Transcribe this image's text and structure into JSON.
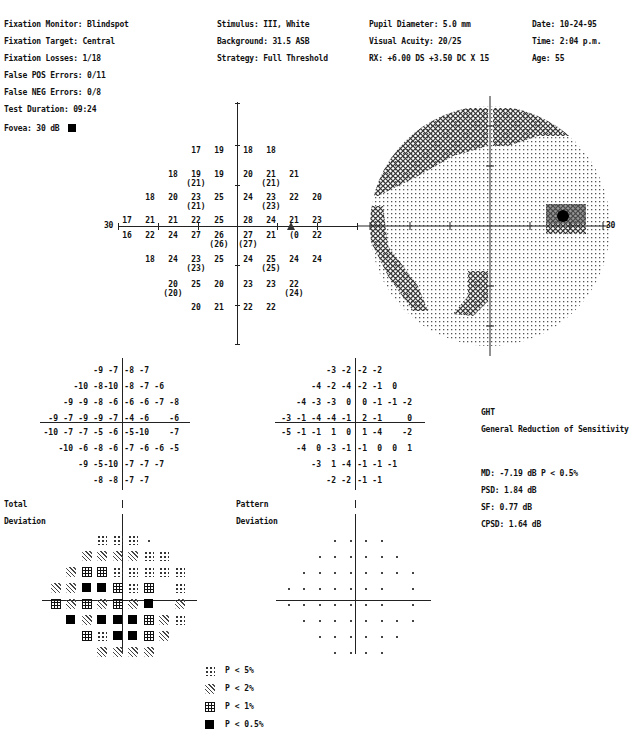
{
  "header": {
    "col1": [
      "Fixation Monitor: Blindspot",
      "Fixation Target: Central",
      "Fixation Losses: 1/18",
      "False POS Errors: 0/11",
      "False NEG Errors: 0/8",
      "Test Duration: 09:24"
    ],
    "col2": [
      "Stimulus: III, White",
      "Background: 31.5 ASB",
      "Strategy: Full Threshold"
    ],
    "col3": [
      "Pupil Diameter: 5.0 mm",
      "Visual Acuity: 20/25",
      "RX: +6.00 DS   +3.50 DC  X  15"
    ],
    "col4": [
      "Date: 10-24-95",
      "Time:  2:04 p.m.",
      "Age: 55"
    ]
  },
  "fovea": {
    "label": "Fovea: 30 dB"
  },
  "threshold_plot": {
    "axis_label_left": "30",
    "axis_label_right": "30",
    "rows": [
      {
        "y": 146,
        "cells": [
          {
            "c": 3,
            "v": "17"
          },
          {
            "c": 4,
            "v": "19"
          },
          {
            "c": 5,
            "v": "18"
          },
          {
            "c": 6,
            "v": "18"
          }
        ]
      },
      {
        "y": 170,
        "cells": [
          {
            "c": 2,
            "v": "18"
          },
          {
            "c": 3,
            "v": "19",
            "r": "(21)"
          },
          {
            "c": 4,
            "v": "19"
          },
          {
            "c": 5,
            "v": "20"
          },
          {
            "c": 6,
            "v": "21",
            "r": "(21)"
          },
          {
            "c": 7,
            "v": "21"
          }
        ]
      },
      {
        "y": 193,
        "cells": [
          {
            "c": 1,
            "v": "18"
          },
          {
            "c": 2,
            "v": "20"
          },
          {
            "c": 3,
            "v": "23",
            "r": "(21)"
          },
          {
            "c": 4,
            "v": "25"
          },
          {
            "c": 5,
            "v": "24"
          },
          {
            "c": 6,
            "v": "23",
            "r": "(23)"
          },
          {
            "c": 7,
            "v": "22"
          },
          {
            "c": 8,
            "v": "20"
          }
        ]
      },
      {
        "y": 216,
        "cells": [
          {
            "c": 0,
            "v": "17"
          },
          {
            "c": 1,
            "v": "21"
          },
          {
            "c": 2,
            "v": "21"
          },
          {
            "c": 3,
            "v": "22"
          },
          {
            "c": 4,
            "v": "25"
          },
          {
            "c": 5,
            "v": "28"
          },
          {
            "c": 6,
            "v": "24"
          },
          {
            "c": 7,
            "v": "21"
          },
          {
            "c": 8,
            "v": "23"
          }
        ]
      },
      {
        "y": 231,
        "cells": [
          {
            "c": 0,
            "v": "16"
          },
          {
            "c": 1,
            "v": "22"
          },
          {
            "c": 2,
            "v": "24"
          },
          {
            "c": 3,
            "v": "27"
          },
          {
            "c": 4,
            "v": "26",
            "r": "(26)"
          },
          {
            "c": 5,
            "v": "27",
            "r": "(27)"
          },
          {
            "c": 6,
            "v": "21"
          },
          {
            "c": 7,
            "v": "(0"
          },
          {
            "c": 8,
            "v": "22"
          }
        ]
      },
      {
        "y": 255,
        "cells": [
          {
            "c": 1,
            "v": "18"
          },
          {
            "c": 2,
            "v": "24"
          },
          {
            "c": 3,
            "v": "23",
            "r": "(23)"
          },
          {
            "c": 4,
            "v": "25"
          },
          {
            "c": 5,
            "v": "24"
          },
          {
            "c": 6,
            "v": "25",
            "r": "(25)"
          },
          {
            "c": 7,
            "v": "24"
          },
          {
            "c": 8,
            "v": "24"
          }
        ]
      },
      {
        "y": 280,
        "cells": [
          {
            "c": 2,
            "v": "20",
            "r": "(20)"
          },
          {
            "c": 3,
            "v": "25"
          },
          {
            "c": 4,
            "v": "20"
          },
          {
            "c": 5,
            "v": "23"
          },
          {
            "c": 6,
            "v": "23"
          },
          {
            "c": 7,
            "v": "22",
            "r": "(24)"
          }
        ]
      },
      {
        "y": 303,
        "cells": [
          {
            "c": 3,
            "v": "20"
          },
          {
            "c": 4,
            "v": "21"
          },
          {
            "c": 5,
            "v": "22"
          },
          {
            "c": 6,
            "v": "22"
          }
        ]
      }
    ]
  },
  "total_deviation": {
    "title_line1": "Total",
    "title_line2": "Deviation",
    "rows": [
      [
        "",
        "",
        "",
        "-9",
        "-7",
        "-8",
        "-7",
        "",
        ""
      ],
      [
        "",
        "",
        "-10",
        "-8",
        "-10",
        "-8",
        "-7",
        "-6",
        ""
      ],
      [
        "",
        "-9",
        "-9",
        "-8",
        "-6",
        "-6",
        "-6",
        "-7",
        "-8"
      ],
      [
        "-9",
        "-7",
        "-9",
        "-9",
        "-7",
        "-4",
        "-6",
        "",
        "-6"
      ],
      [
        "-10",
        "-7",
        "-7",
        "-5",
        "-6",
        "-5",
        "-10",
        "",
        "-7"
      ],
      [
        "",
        "-10",
        "-6",
        "-8",
        "-6",
        "-7",
        "-6",
        "-6",
        "-5"
      ],
      [
        "",
        "",
        "-9",
        "-5",
        "-10",
        "-7",
        "-7",
        "-7",
        ""
      ],
      [
        "",
        "",
        "",
        "-8",
        "-8",
        "-7",
        "-7",
        "",
        ""
      ]
    ],
    "symbols": [
      [
        "",
        "",
        "",
        "p5",
        "p5",
        "p5",
        "dot",
        "",
        ""
      ],
      [
        "",
        "",
        "p2",
        "p2",
        "p2",
        "p2",
        "p5",
        "p5",
        ""
      ],
      [
        "",
        "p2",
        "p1",
        "p1",
        "p5",
        "p5",
        "p5",
        "p5",
        "p5"
      ],
      [
        "p2",
        "p2",
        "p05",
        "p05",
        "p1",
        "p5",
        "p1",
        "",
        "p5"
      ],
      [
        "p1",
        "p2",
        "p1",
        "p2",
        "p1",
        "p2",
        "p05",
        "",
        "p2"
      ],
      [
        "",
        "p05",
        "p2",
        "p05",
        "p05",
        "p05",
        "p1",
        "p2",
        "p5"
      ],
      [
        "",
        "",
        "p1",
        "p5",
        "p05",
        "p05",
        "p1",
        "p2",
        ""
      ],
      [
        "",
        "",
        "",
        "p2",
        "p2",
        "p2",
        "p2",
        "",
        ""
      ]
    ]
  },
  "pattern_deviation": {
    "title_line1": "Pattern",
    "title_line2": "Deviation",
    "rows": [
      [
        "",
        "",
        "",
        "-3",
        "-2",
        "-2",
        "-2",
        "",
        ""
      ],
      [
        "",
        "",
        "-4",
        "-2",
        "-4",
        "-2",
        "-1",
        "0",
        ""
      ],
      [
        "",
        "-4",
        "-3",
        "-3",
        "0",
        "0",
        "-1",
        "-1",
        "-2"
      ],
      [
        "-3",
        "-1",
        "-4",
        "-4",
        "-1",
        "2",
        "-1",
        "",
        "0"
      ],
      [
        "-5",
        "-1",
        "-1",
        "1",
        "0",
        "1",
        "-4",
        "",
        "-2"
      ],
      [
        "",
        "-4",
        "0",
        "-3",
        "-1",
        "-1",
        "0",
        "0",
        "1"
      ],
      [
        "",
        "",
        "-3",
        "1",
        "-4",
        "-1",
        "-1",
        "-1",
        ""
      ],
      [
        "",
        "",
        "",
        "-2",
        "-2",
        "-1",
        "-1",
        "",
        ""
      ]
    ]
  },
  "ght": {
    "label": "GHT",
    "result": "General Reduction of Sensitivity"
  },
  "global_indices": {
    "md": "MD: -7.19  dB  P < 0.5%",
    "psd": "PSD: 1.84   dB",
    "sf": "SF: 0.77   dB",
    "cpsd": "CPSD: 1.64   dB"
  },
  "legend": [
    {
      "sym": "p5",
      "label": "P < 5%"
    },
    {
      "sym": "p2",
      "label": "P < 2%"
    },
    {
      "sym": "p1",
      "label": "P < 1%"
    },
    {
      "sym": "p05",
      "label": "P < 0.5%"
    }
  ]
}
